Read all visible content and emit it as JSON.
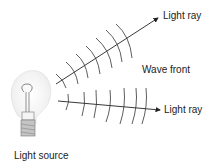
{
  "labels": {
    "ray_top": "Light ray",
    "wave_front": "Wave front",
    "ray_bottom": "Light ray",
    "source": "Light source"
  },
  "colors": {
    "line": "#222222",
    "bulb_glow": "#e8e8e8",
    "bulb_base": "#9a9a9a"
  }
}
